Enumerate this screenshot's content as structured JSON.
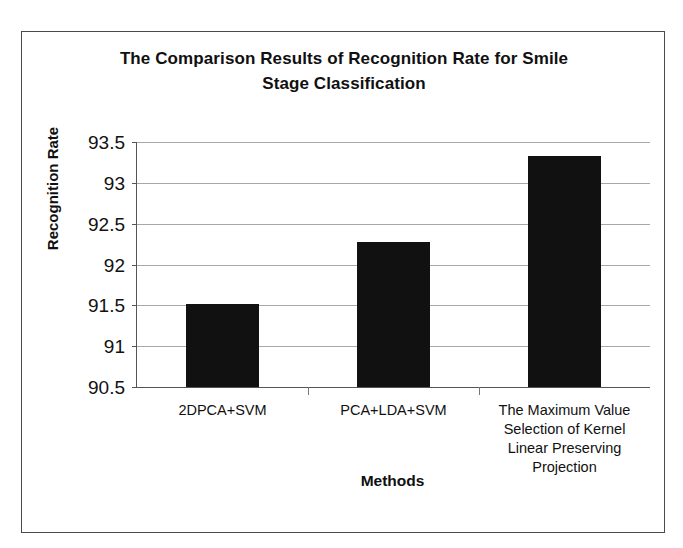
{
  "figure": {
    "border_color": "#4a4a4a",
    "background": "#ffffff"
  },
  "chart_data": {
    "type": "bar",
    "title": "The Comparison Results of Recognition Rate for Smile Stage Classification",
    "title_line1": "The Comparison Results of Recognition Rate for Smile",
    "title_line2": "Stage Classification",
    "xlabel": "Methods",
    "ylabel": "Recognition Rate",
    "categories": [
      "2DPCA+SVM",
      "PCA+LDA+SVM",
      "The Maximum Value Selection of Kernel Linear Preserving Projection"
    ],
    "category_lines": [
      [
        "2DPCA+SVM"
      ],
      [
        "PCA+LDA+SVM"
      ],
      [
        "The Maximum Value",
        "Selection of Kernel",
        "Linear Preserving",
        "Projection"
      ]
    ],
    "values": [
      91.52,
      92.27,
      93.33
    ],
    "ylim": [
      90.5,
      93.5
    ],
    "ytick_labels": [
      "93.5",
      "93",
      "92.5",
      "92",
      "91.5",
      "91",
      "90.5"
    ],
    "ytick_values": [
      93.5,
      93,
      92.5,
      92,
      91.5,
      91,
      90.5
    ],
    "grid": true,
    "legend": false,
    "bar_color": "#111111",
    "gridline_color": "#a8a8a8",
    "axis_color": "#555555"
  }
}
